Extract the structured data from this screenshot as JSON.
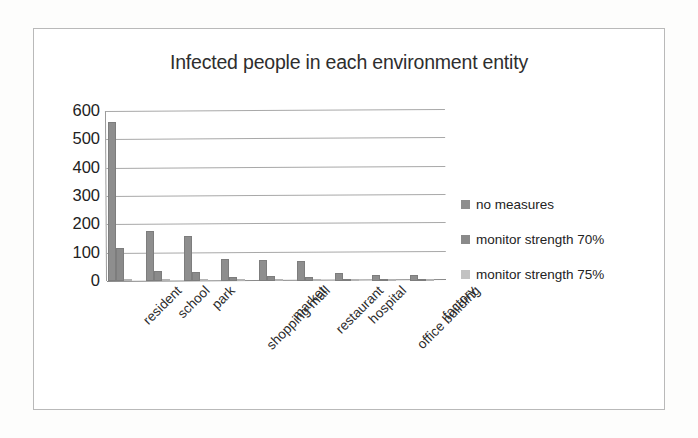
{
  "frame": {
    "border_color": "#b9b9b9",
    "background": "#ffffff"
  },
  "chart_data": {
    "type": "bar",
    "title": "Infected people in each environment entity",
    "xlabel": "",
    "ylabel": "",
    "ylim": [
      0,
      600
    ],
    "yticks": [
      "0",
      "100",
      "200",
      "300",
      "400",
      "500",
      "600"
    ],
    "grid": true,
    "legend_position": "right",
    "categories": [
      "resident",
      "school",
      "park",
      "shopping mall",
      "market",
      "restaurant",
      "hospital",
      "office building",
      "factory"
    ],
    "series": [
      {
        "name": "no measures",
        "color": "#8e8e8e",
        "values": [
          560,
          175,
          160,
          78,
          75,
          72,
          30,
          20,
          20
        ]
      },
      {
        "name": "monitor strength 70%",
        "color": "#8a8a8a",
        "values": [
          115,
          35,
          32,
          15,
          18,
          14,
          6,
          5,
          4
        ]
      },
      {
        "name": "monitor strength 75%",
        "color": "#c2c2c2",
        "values": [
          6,
          4,
          4,
          3,
          3,
          2,
          2,
          2,
          2
        ]
      }
    ]
  }
}
